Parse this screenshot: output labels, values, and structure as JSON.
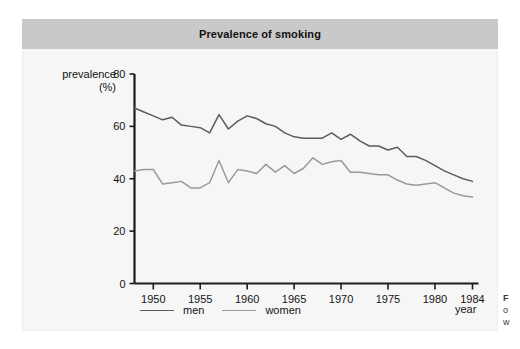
{
  "figure": {
    "title": "Prevalence of smoking",
    "title_band_color": "#c9c9c9",
    "panel_color": "#f6f6f6"
  },
  "axes": {
    "y_label_line1": "prevalence",
    "y_label_line2": "(%)",
    "x_label": "year"
  },
  "legend": {
    "items": [
      {
        "label": "men",
        "color": "#5c5c5c"
      },
      {
        "label": "women",
        "color": "#9a9a9a"
      }
    ]
  },
  "caption_sliver": {
    "line1": "F",
    "line2": "o",
    "line3": "w"
  },
  "chart_data": {
    "type": "line",
    "title": "Prevalence of smoking",
    "xlabel": "year",
    "ylabel": "prevalence (%)",
    "xlim": [
      1948,
      1984
    ],
    "ylim": [
      0,
      80
    ],
    "grid": false,
    "legend_position": "bottom-left",
    "x_ticks": [
      1950,
      1955,
      1960,
      1965,
      1970,
      1975,
      1980,
      1984
    ],
    "y_ticks": [
      0,
      20,
      40,
      60,
      80
    ],
    "x": [
      1948,
      1949,
      1950,
      1951,
      1952,
      1953,
      1954,
      1955,
      1956,
      1957,
      1958,
      1959,
      1960,
      1961,
      1962,
      1963,
      1964,
      1965,
      1966,
      1967,
      1968,
      1969,
      1970,
      1971,
      1972,
      1973,
      1974,
      1975,
      1976,
      1977,
      1978,
      1979,
      1980,
      1981,
      1982,
      1983,
      1984
    ],
    "series": [
      {
        "name": "men",
        "color": "#5c5c5c",
        "values": [
          67.0,
          65.5,
          64.0,
          62.5,
          63.5,
          60.5,
          60.0,
          59.5,
          57.5,
          64.5,
          59.0,
          62.0,
          64.0,
          63.0,
          61.0,
          60.0,
          57.5,
          56.0,
          55.5,
          55.5,
          55.5,
          57.5,
          55.0,
          57.0,
          54.5,
          52.5,
          52.5,
          51.0,
          52.0,
          48.5,
          48.5,
          47.0,
          45.0,
          43.0,
          41.5,
          40.0,
          39.0
        ]
      },
      {
        "name": "women",
        "color": "#9a9a9a",
        "values": [
          43.0,
          43.5,
          43.5,
          38.0,
          38.5,
          39.0,
          36.5,
          36.5,
          38.5,
          47.0,
          38.5,
          43.5,
          43.0,
          42.0,
          45.5,
          42.5,
          45.0,
          42.0,
          44.0,
          48.0,
          45.5,
          46.5,
          47.0,
          42.5,
          42.5,
          42.0,
          41.5,
          41.5,
          39.5,
          38.0,
          37.5,
          38.0,
          38.5,
          36.5,
          34.5,
          33.5,
          33.0
        ]
      }
    ]
  }
}
